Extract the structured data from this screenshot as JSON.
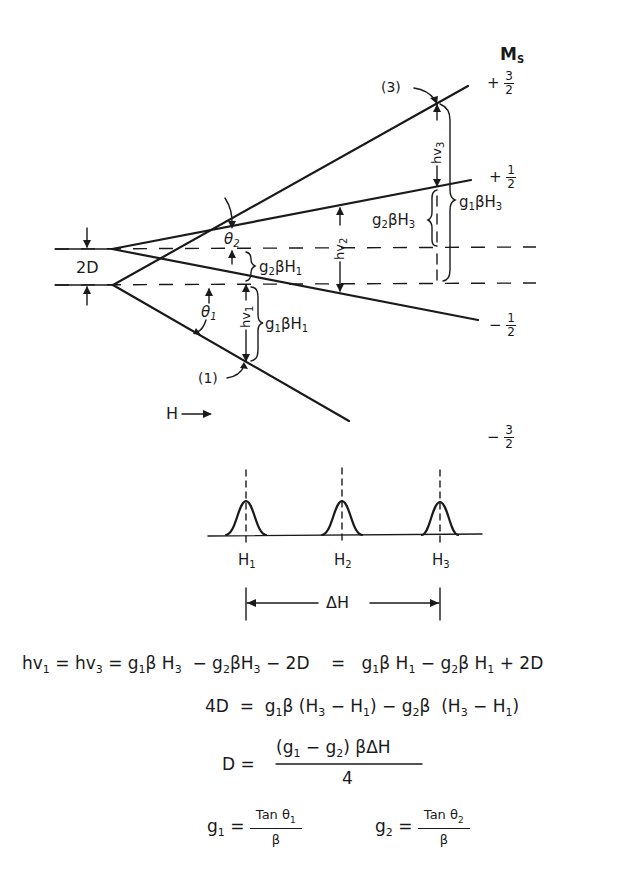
{
  "diagram": {
    "type": "energy-level-diagram",
    "axis_label": "M",
    "axis_label_sub": "S",
    "levels": [
      {
        "name": "plus-three-halves",
        "sign": "+",
        "num": "3",
        "den": "2"
      },
      {
        "name": "plus-one-half",
        "sign": "+",
        "num": "1",
        "den": "2"
      },
      {
        "name": "minus-one-half",
        "sign": "−",
        "num": "1",
        "den": "2"
      },
      {
        "name": "minus-three-halves",
        "sign": "−",
        "num": "3",
        "den": "2"
      }
    ],
    "zero_field_splitting": "2D",
    "angles": {
      "theta1": "θ",
      "theta1_sub": "1",
      "theta2": "θ",
      "theta2_sub": "2"
    },
    "transitions": [
      {
        "label": "(1)",
        "hv": "hv",
        "hv_sub": "1"
      },
      {
        "label": "hv",
        "hv_sub": "2"
      },
      {
        "label": "(3)",
        "hv": "hv",
        "hv_sub": "3"
      }
    ],
    "braces": {
      "g1bH1": {
        "pre": "g",
        "pre_sub": "1",
        "mid": "βH",
        "post_sub": "1"
      },
      "g2bH1": {
        "pre": "g",
        "pre_sub": "2",
        "mid": "βH",
        "post_sub": "1"
      },
      "g2bH3": {
        "pre": "g",
        "pre_sub": "2",
        "mid": "βH",
        "post_sub": "3"
      },
      "g1bH3": {
        "pre": "g",
        "pre_sub": "1",
        "mid": "βH",
        "post_sub": "3"
      }
    },
    "field_label": "H",
    "field_arrow": "⟶",
    "spectrum": {
      "peaks": [
        {
          "label": "H",
          "sub": "1"
        },
        {
          "label": "H",
          "sub": "2"
        },
        {
          "label": "H",
          "sub": "3"
        }
      ],
      "span_label": "ΔH"
    }
  },
  "equations": {
    "eq1": {
      "lhs": "hv",
      "lhs_sub": "1",
      "eq": " = hv",
      "eq_sub": "3",
      "rhs1": " = g",
      "rhs1_sub": "1",
      "rhs1b": "β H",
      "rhs1b_sub": "3",
      "rhs2": "  − g",
      "rhs2_sub": "2",
      "rhs2b": "βH",
      "rhs2b_sub": "3",
      "rhs3": " − 2D    =   g",
      "rhs3_sub": "1",
      "rhs4": "β H",
      "rhs4_sub": "1",
      "rhs5": " − g",
      "rhs5_sub": "2",
      "rhs6": "β H",
      "rhs6_sub": "1",
      "rhs7": " + 2D"
    },
    "eq2": {
      "a": "4D  =  g",
      "a_sub": "1",
      "b": "β (H",
      "b_sub": "3",
      "c": " − H",
      "c_sub": "1",
      "d": ") − g",
      "d_sub": "2",
      "e": "β  (H",
      "e_sub": "3",
      "f": " − H",
      "f_sub": "1",
      "g": ")"
    },
    "eq3": {
      "lhs": "D =",
      "num_a": "(g",
      "num_a_sub": "1",
      "num_b": " − g",
      "num_b_sub": "2",
      "num_c": ") βΔH",
      "den": "4"
    },
    "eq4": {
      "g1": "g",
      "g1_sub": "1",
      "g1_eq": " =",
      "g1_num": "Tan θ",
      "g1_num_sub": "1",
      "g1_den": "β",
      "g2": "g",
      "g2_sub": "2",
      "g2_eq": " =",
      "g2_num": "Tan θ",
      "g2_num_sub": "2",
      "g2_den": "β"
    }
  }
}
